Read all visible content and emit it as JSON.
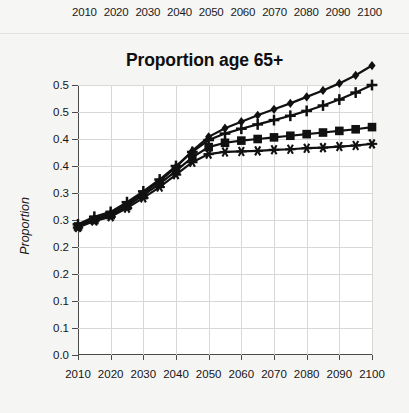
{
  "top_strip": {
    "name": "cropped-chart-above",
    "xtick_labels": [
      "2010",
      "2020",
      "2030",
      "2040",
      "2050",
      "2060",
      "2070",
      "2080",
      "2090",
      "2100"
    ]
  },
  "chart_data": {
    "type": "line",
    "title": "Proportion age 65+",
    "xlabel": "",
    "ylabel": "Proportion",
    "grid": true,
    "legend": "none",
    "xlim": [
      2010,
      2100
    ],
    "ylim": [
      0.0,
      0.5
    ],
    "x_tick_labels": [
      "2010",
      "2020",
      "2030",
      "2040",
      "2050",
      "2060",
      "2070",
      "2080",
      "2090",
      "2100"
    ],
    "x_tick_values": [
      2010,
      2020,
      2030,
      2040,
      2050,
      2060,
      2070,
      2080,
      2090,
      2100
    ],
    "y_tick_labels": [
      "0.0",
      "0.1",
      "0.1",
      "0.2",
      "0.2",
      "0.3",
      "0.3",
      "0.4",
      "0.4",
      "0.5",
      "0.5"
    ],
    "y_tick_values": [
      0.0,
      0.05,
      0.1,
      0.15,
      0.2,
      0.25,
      0.3,
      0.35,
      0.4,
      0.45,
      0.5
    ],
    "x": [
      2010,
      2015,
      2020,
      2025,
      2030,
      2035,
      2040,
      2045,
      2050,
      2055,
      2060,
      2065,
      2070,
      2075,
      2080,
      2085,
      2090,
      2095,
      2100
    ],
    "series": [
      {
        "name": "series-diamond",
        "marker": "diamond",
        "color": "#111111",
        "values": [
          0.24,
          0.253,
          0.262,
          0.28,
          0.3,
          0.322,
          0.348,
          0.378,
          0.404,
          0.42,
          0.432,
          0.444,
          0.455,
          0.466,
          0.478,
          0.49,
          0.503,
          0.518,
          0.536
        ]
      },
      {
        "name": "series-plus",
        "marker": "plus",
        "color": "#111111",
        "values": [
          0.242,
          0.256,
          0.265,
          0.283,
          0.303,
          0.325,
          0.35,
          0.376,
          0.398,
          0.41,
          0.419,
          0.427,
          0.435,
          0.443,
          0.452,
          0.462,
          0.473,
          0.486,
          0.5
        ]
      },
      {
        "name": "series-square",
        "marker": "square",
        "color": "#111111",
        "values": [
          0.238,
          0.25,
          0.259,
          0.276,
          0.296,
          0.317,
          0.341,
          0.366,
          0.385,
          0.393,
          0.397,
          0.4,
          0.403,
          0.406,
          0.409,
          0.412,
          0.415,
          0.418,
          0.422
        ]
      },
      {
        "name": "series-asterisk",
        "marker": "asterisk",
        "color": "#111111",
        "values": [
          0.236,
          0.248,
          0.256,
          0.272,
          0.291,
          0.311,
          0.334,
          0.357,
          0.372,
          0.376,
          0.377,
          0.378,
          0.38,
          0.381,
          0.383,
          0.384,
          0.386,
          0.388,
          0.391
        ]
      }
    ]
  }
}
